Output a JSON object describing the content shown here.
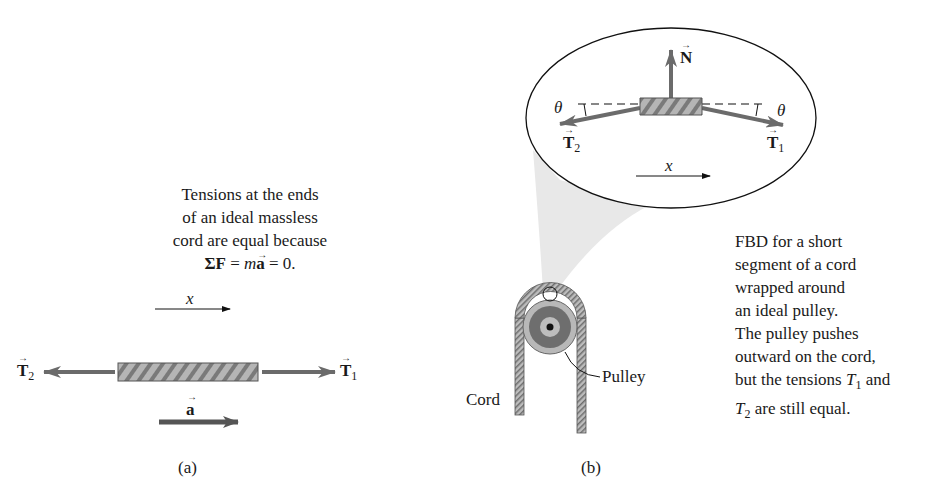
{
  "panel_a": {
    "caption_lines": [
      "Tensions at the ends",
      "of an ideal massless",
      "cord are equal because"
    ],
    "equation": {
      "sum": "ΣF",
      "eq1": " = ",
      "m": "m",
      "a": "a",
      "eq2": " = 0."
    },
    "axis_label": "x",
    "force_left": {
      "symbol": "T",
      "subscript": "2"
    },
    "force_right": {
      "symbol": "T",
      "subscript": "1"
    },
    "accel_label": "a",
    "panel_label": "(a)"
  },
  "panel_b": {
    "inset": {
      "normal_force": "N",
      "theta_left": "θ",
      "theta_right": "θ",
      "force_left": {
        "symbol": "T",
        "subscript": "2"
      },
      "force_right": {
        "symbol": "T",
        "subscript": "1"
      },
      "axis_label": "x"
    },
    "cord_label": "Cord",
    "pulley_label": "Pulley",
    "description_lines": [
      "FBD for a short",
      "segment of a cord",
      "wrapped around",
      "an ideal pulley.",
      "The pulley pushes",
      "outward on the cord,"
    ],
    "description_tail": {
      "pre": "but the tensions ",
      "t1": "T",
      "t1_sub": "1",
      "mid": " and",
      "t2": "T",
      "t2_sub": "2",
      "post": " are still equal."
    },
    "panel_label": "(b)"
  },
  "colors": {
    "arrow_gray": "#6b6b6b",
    "rope_fill": "#a9a9a9",
    "pulley_dark": "#6e6e6e",
    "pulley_light": "#b8b8b8",
    "magnifier_shade": "#e6e6e6"
  }
}
